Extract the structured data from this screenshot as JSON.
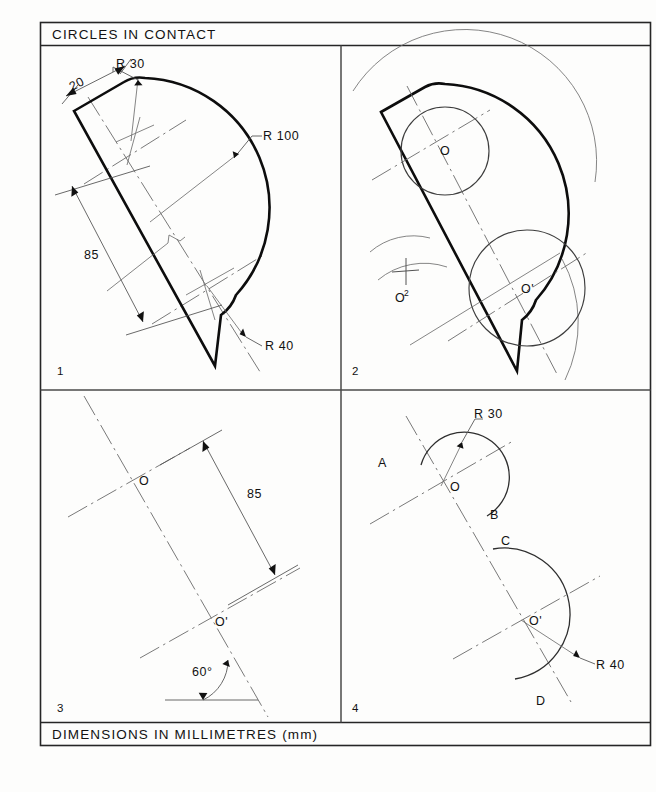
{
  "sheet": {
    "title": "CIRCLES IN CONTACT",
    "footer": "DIMENSIONS IN MILLIMETRES (mm)"
  },
  "panels": [
    {
      "number": "1",
      "labels": {
        "r30": "R 30",
        "r100": "R 100",
        "r40": "R 40",
        "dim20": "20",
        "dim85": "85"
      }
    },
    {
      "number": "2",
      "labels": {
        "o": "O",
        "o_prime": "O'",
        "o_two_base": "O",
        "o_two_sup": "2"
      }
    },
    {
      "number": "3",
      "labels": {
        "o": "O",
        "o_prime": "O'",
        "dim85": "85",
        "angle": "60°"
      }
    },
    {
      "number": "4",
      "labels": {
        "r30": "R 30",
        "r40": "R 40",
        "o": "O",
        "o_prime": "O'",
        "arc_a": "A",
        "arc_b": "B",
        "arc_c": "C",
        "arc_d": "D"
      }
    }
  ],
  "colors": {
    "ink": "#121212",
    "outline": "#0d0d0d",
    "construction": "#6f6f6f",
    "paper": "#fdfdfc"
  }
}
